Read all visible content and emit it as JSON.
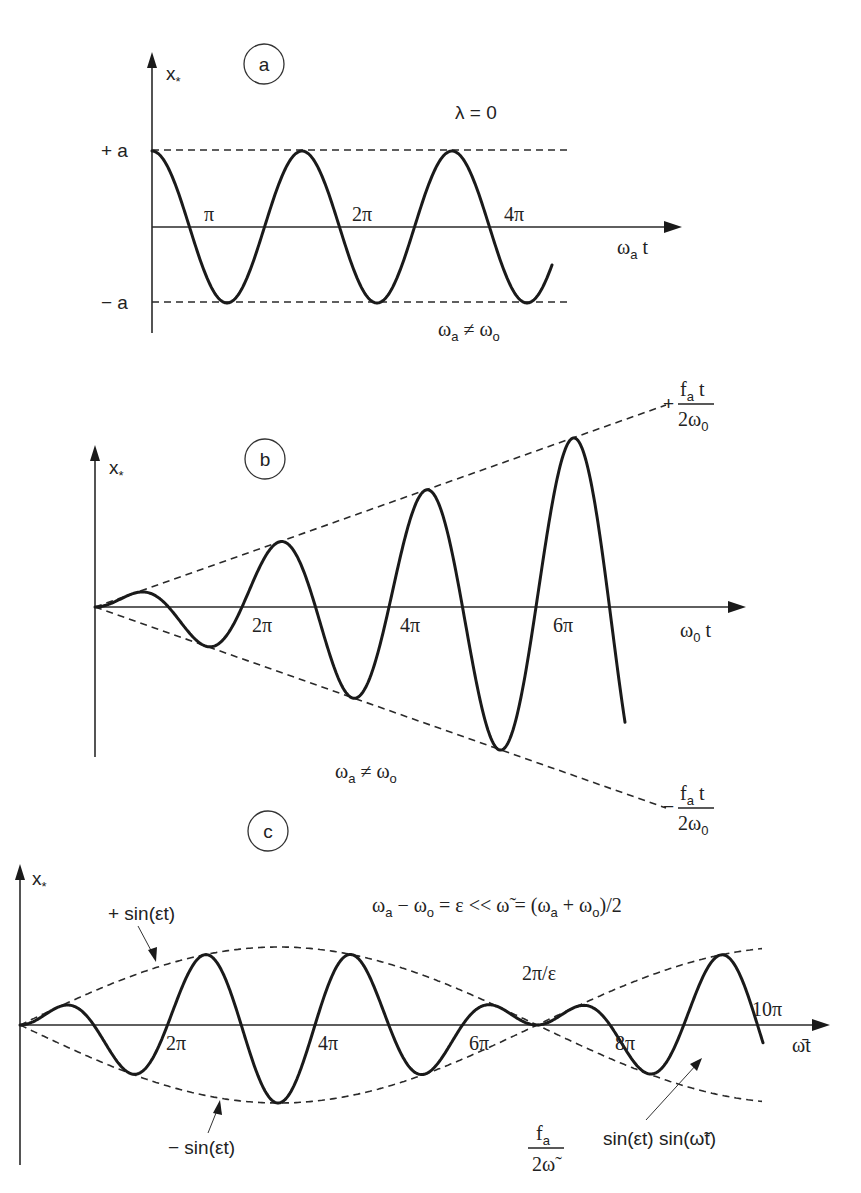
{
  "figure": {
    "panels": [
      {
        "id": "a",
        "badge": "a",
        "y_label": "x",
        "y_label_sub": "*",
        "x_label": "ω",
        "x_label_sub": "a",
        "x_label_tail": " t",
        "condition": "λ = 0",
        "note": "ωa ≠ ωo",
        "note_parts": {
          "w1": "ω",
          "s1": "a",
          "ne": " ≠ ω",
          "s2": "o"
        },
        "level_labels": {
          "upper": "+ a",
          "lower": "− a"
        },
        "ticks": [
          "π",
          "2π",
          "4π"
        ]
      },
      {
        "id": "b",
        "badge": "b",
        "y_label": "x",
        "y_label_sub": "*",
        "x_label": "ω",
        "x_label_sub": "0",
        "x_label_tail": " t",
        "note_parts": {
          "w1": "ω",
          "s1": "a",
          "ne": " ≠ ω",
          "s2": "o"
        },
        "envelope_upper": {
          "sign": "+",
          "num": "f",
          "num_sub": "a",
          "num_tail": " t",
          "den": "2ω",
          "den_sub": "0"
        },
        "envelope_lower": {
          "sign": "−",
          "num": "f",
          "num_sub": "a",
          "num_tail": " t",
          "den": "2ω",
          "den_sub": "0"
        },
        "ticks": [
          "2π",
          "4π",
          "6π"
        ]
      },
      {
        "id": "c",
        "badge": "c",
        "y_label": "x",
        "y_label_sub": "*",
        "x_label": "ω̄t",
        "relation": {
          "p1": "ω",
          "s1": "a",
          "p2": " − ω",
          "s2": "o",
          "p3": " = ε << ω̃ = (ω",
          "s3": "a",
          "p4": " + ω",
          "s4": "o",
          "p5": ")/2"
        },
        "envelope_upper_label": "+ sin(εt)",
        "envelope_lower_label": "− sin(εt)",
        "beat_label": "2π/ε",
        "amplitude": {
          "num": "f",
          "num_sub": "a",
          "den": "2ω̃"
        },
        "product_label": "sin(εt) sin(ω̃t)",
        "ticks": [
          "2π",
          "4π",
          "6π",
          "8π",
          "10π"
        ]
      }
    ]
  },
  "chart_data": [
    {
      "type": "line",
      "title": "(a) λ = 0, ωa ≠ ωo — steady oscillation",
      "xlabel": "ωa t",
      "ylabel": "x*",
      "x_ticks": [
        "π",
        "2π",
        "4π"
      ],
      "bounds": [
        "+a",
        "−a"
      ],
      "series": [
        {
          "name": "x*",
          "form": "a·cos(ωa t)",
          "x_range_rad": [
            0,
            15.2
          ],
          "amplitude": 1
        }
      ]
    },
    {
      "type": "line",
      "title": "(b) resonance — linearly growing amplitude",
      "xlabel": "ω0 t",
      "ylabel": "x*",
      "x_ticks": [
        "2π",
        "4π",
        "6π"
      ],
      "envelopes": [
        "+ fa t / (2ω0)",
        "− fa t / (2ω0)"
      ],
      "series": [
        {
          "name": "x*",
          "form": "(fa t / 2ω0)·sin(ω0 t)",
          "x_range_rad": [
            0,
            21.6
          ]
        }
      ],
      "annotation": "ωa ≠ ωo"
    },
    {
      "type": "line",
      "title": "(c) beats",
      "xlabel": "ω̄t",
      "ylabel": "x*",
      "x_ticks": [
        "2π",
        "4π",
        "6π",
        "8π",
        "10π"
      ],
      "relation": "ωa − ωo = ε << ω̃ = (ωa + ωo)/2",
      "envelopes": [
        "+ sin(εt)",
        "− sin(εt)"
      ],
      "envelope_period": "2π/ε",
      "amplitude": "fa / (2ω̃)",
      "series": [
        {
          "name": "x*",
          "form": "sin(εt)·sin(ω̃t)",
          "x_range_rad": [
            0,
            31.4
          ]
        }
      ]
    }
  ]
}
